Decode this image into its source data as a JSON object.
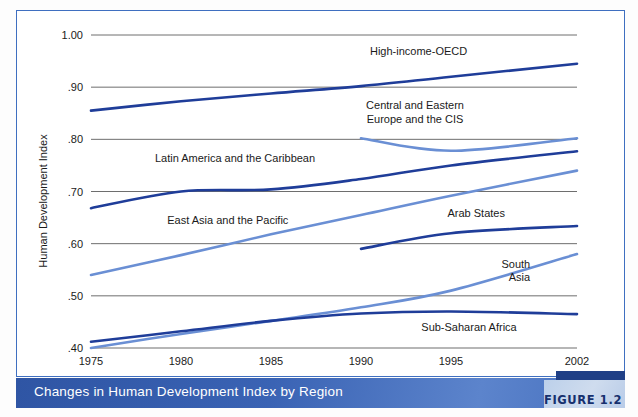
{
  "caption": {
    "text": "Changes in Human Development Index by Region",
    "figure_badge": "FIGURE 1.2"
  },
  "colors": {
    "dark_blue": "#1f3d99",
    "light_blue": "#6a8fd4",
    "frame_blue": "#3f6fc0",
    "caption_blue": "#3a63b4",
    "badge_navy": "#1f3f86",
    "gridline": "#6e6e6e"
  },
  "chart_data": {
    "type": "line",
    "title": "Changes in Human Development Index by Region",
    "xlabel": "",
    "ylabel": "Human Development Index",
    "x": [
      1975,
      1980,
      1985,
      1990,
      1995,
      2002
    ],
    "xtick_labels": [
      "1975",
      "1980",
      "1985",
      "1990",
      "1995",
      "2002"
    ],
    "ytick_labels": [
      ".40",
      ".50",
      ".60",
      ".70",
      ".80",
      ".90",
      "1.00"
    ],
    "yticks": [
      0.4,
      0.5,
      0.6,
      0.7,
      0.8,
      0.9,
      1.0
    ],
    "ylim": [
      0.4,
      1.0
    ],
    "grid": "horizontal",
    "legend": "inline-labels",
    "series": [
      {
        "name": "High-income-OECD",
        "color": "#1f3d99",
        "label_x": 1993.2,
        "label_y": 0.962,
        "label_anchor": "middle",
        "x": [
          1975,
          1980,
          1985,
          1990,
          1995,
          2002
        ],
        "values": [
          0.855,
          0.873,
          0.888,
          0.902,
          0.92,
          0.945
        ]
      },
      {
        "name": "Central and Eastern Europe and the CIS",
        "color": "#6a8fd4",
        "label_lines": [
          "Central and Eastern",
          "Europe and the CIS"
        ],
        "label_x": 1993.0,
        "label_y": 0.858,
        "label_anchor": "middle",
        "x": [
          1990,
          1995,
          2002
        ],
        "values": [
          0.802,
          0.778,
          0.802
        ]
      },
      {
        "name": "Latin America and the Caribbean",
        "color": "#1f3d99",
        "label_x": 1983.0,
        "label_y": 0.757,
        "label_anchor": "middle",
        "x": [
          1975,
          1980,
          1985,
          1990,
          1995,
          2002
        ],
        "values": [
          0.668,
          0.7,
          0.704,
          0.724,
          0.75,
          0.777
        ]
      },
      {
        "name": "East Asia and the Pacific",
        "color": "#6a8fd4",
        "label_x": 1982.6,
        "label_y": 0.638,
        "label_anchor": "middle",
        "x": [
          1975,
          1980,
          1985,
          1990,
          1995,
          2002
        ],
        "values": [
          0.54,
          0.578,
          0.618,
          0.655,
          0.692,
          0.74
        ]
      },
      {
        "name": "Arab States",
        "color": "#1f3d99",
        "label_x": 1996.4,
        "label_y": 0.651,
        "label_anchor": "middle",
        "x": [
          1990,
          1995,
          2002
        ],
        "values": [
          0.59,
          0.62,
          0.634
        ]
      },
      {
        "name": "South Asia",
        "color": "#6a8fd4",
        "label_lines": [
          "South",
          "Asia"
        ],
        "label_x": 1999.4,
        "label_y": 0.554,
        "label_anchor": "end",
        "x": [
          1975,
          1980,
          1985,
          1990,
          1995,
          2002
        ],
        "values": [
          0.4,
          0.427,
          0.452,
          0.478,
          0.51,
          0.58
        ]
      },
      {
        "name": "Sub-Saharan Africa",
        "color": "#1f3d99",
        "label_x": 1996.0,
        "label_y": 0.432,
        "label_anchor": "middle",
        "x": [
          1975,
          1980,
          1985,
          1990,
          1995,
          2002
        ],
        "values": [
          0.412,
          0.432,
          0.452,
          0.466,
          0.47,
          0.465
        ]
      }
    ]
  }
}
